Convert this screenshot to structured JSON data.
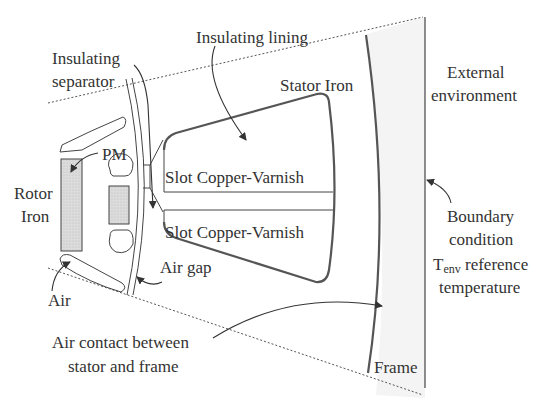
{
  "diagram": {
    "colors": {
      "line": "#444444",
      "pm_fill": "#d9d9d9",
      "frame_fill": "#f3f3f3",
      "text": "#333333"
    },
    "labels": {
      "insulating_lining": "Insulating lining",
      "insulating_separator_1": "Insulating",
      "insulating_separator_2": "separator",
      "stator_iron": "Stator Iron",
      "external_env_1": "External",
      "external_env_2": "environment",
      "pm": "PM",
      "rotor_iron_1": "Rotor",
      "rotor_iron_2": "Iron",
      "slot_upper": "Slot Copper-Varnish",
      "slot_lower": "Slot Copper-Varnish",
      "air_gap": "Air gap",
      "air": "Air",
      "boundary_1": "Boundary",
      "boundary_2": "condition",
      "boundary_3_T": "T",
      "boundary_3_sub": "env",
      "boundary_3_rest": " reference",
      "boundary_4": "temperature",
      "air_contact_1": "Air contact between",
      "air_contact_2": "stator and frame",
      "frame": "Frame"
    }
  }
}
